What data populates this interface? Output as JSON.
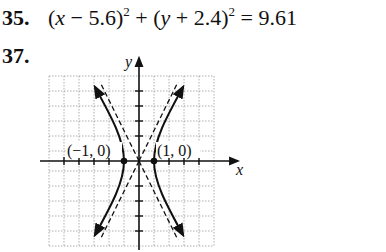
{
  "problems": [
    {
      "number": "35.",
      "equation": {
        "part1_open": "(",
        "var1": "x",
        "op1": " − 5.6)",
        "exp1": "2",
        "plus": " + (",
        "var2": "y",
        "op2": " + 2.4)",
        "exp2": "2",
        "rhs": " = 9.61"
      }
    },
    {
      "number": "37.",
      "graph": {
        "x_axis_label": "x",
        "y_axis_label": "y",
        "points": [
          {
            "label": "(−1, 0)",
            "x": -1,
            "y": 0
          },
          {
            "label": "(1, 0)",
            "x": 1,
            "y": 0
          }
        ],
        "curve": "hyperbola opening left/right with vertices at (±1,0)",
        "asymptotes": "dashed lines through origin",
        "grid": true,
        "x_range": [
          -6,
          5
        ],
        "y_range": [
          -6,
          6
        ]
      }
    }
  ],
  "colors": {
    "ink": "#111111",
    "grid": "#9a9a9a",
    "background": "#ffffff"
  }
}
